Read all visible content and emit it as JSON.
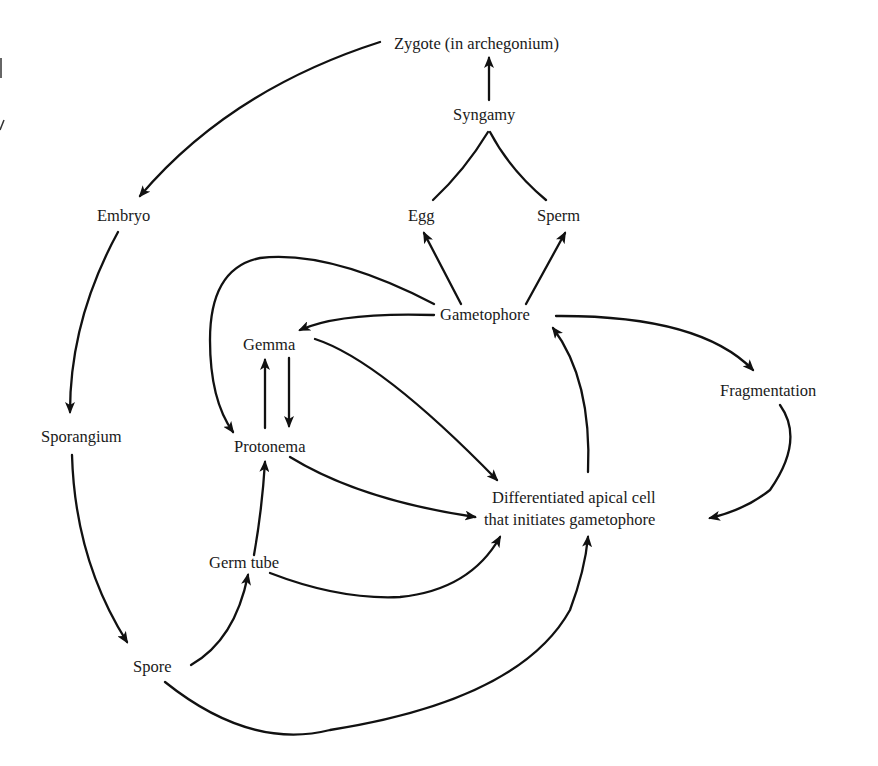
{
  "diagram": {
    "type": "life-cycle flow diagram",
    "colors": {
      "background": "#ffffff",
      "ink": "#111111"
    },
    "nodes": {
      "zygote": "Zygote (in archegonium)",
      "syngamy": "Syngamy",
      "egg": "Egg",
      "sperm": "Sperm",
      "embryo": "Embryo",
      "gametophore": "Gametophore",
      "gemma": "Gemma",
      "fragmentation": "Fragmentation",
      "sporangium": "Sporangium",
      "protonema": "Protonema",
      "apical_line1": "Differentiated apical cell",
      "apical_line2": "that initiates gametophore",
      "germ_tube": "Germ tube",
      "spore": "Spore"
    },
    "edges": [
      {
        "from": "Syngamy",
        "to": "Zygote (in archegonium)"
      },
      {
        "from": "Egg",
        "to": "Syngamy",
        "arrow": false
      },
      {
        "from": "Sperm",
        "to": "Syngamy",
        "arrow": false
      },
      {
        "from": "Zygote (in archegonium)",
        "to": "Embryo"
      },
      {
        "from": "Embryo",
        "to": "Sporangium"
      },
      {
        "from": "Sporangium",
        "to": "Spore"
      },
      {
        "from": "Spore",
        "to": "Germ tube"
      },
      {
        "from": "Spore",
        "to": "Differentiated apical cell that initiates gametophore"
      },
      {
        "from": "Germ tube",
        "to": "Protonema"
      },
      {
        "from": "Germ tube",
        "to": "Differentiated apical cell that initiates gametophore"
      },
      {
        "from": "Protonema",
        "to": "Gemma"
      },
      {
        "from": "Gemma",
        "to": "Protonema"
      },
      {
        "from": "Protonema",
        "to": "Differentiated apical cell that initiates gametophore"
      },
      {
        "from": "Gemma",
        "to": "Differentiated apical cell that initiates gametophore"
      },
      {
        "from": "Differentiated apical cell that initiates gametophore",
        "to": "Gametophore"
      },
      {
        "from": "Gametophore",
        "to": "Egg"
      },
      {
        "from": "Gametophore",
        "to": "Sperm"
      },
      {
        "from": "Gametophore",
        "to": "Gemma"
      },
      {
        "from": "Gametophore",
        "to": "Protonema"
      },
      {
        "from": "Gametophore",
        "to": "Fragmentation"
      },
      {
        "from": "Fragmentation",
        "to": "Differentiated apical cell that initiates gametophore"
      }
    ]
  }
}
